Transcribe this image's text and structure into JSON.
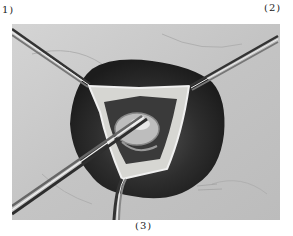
{
  "figure": {
    "panel_labels": {
      "left": "1)",
      "right": "(2)",
      "bottom": "(3)"
    },
    "colors": {
      "background": "#ffffff",
      "drape": "#c8c8c8",
      "cavity": "#2e2e2e",
      "flap": "#d6d6d2",
      "instrument": "#9a9a9a"
    }
  }
}
